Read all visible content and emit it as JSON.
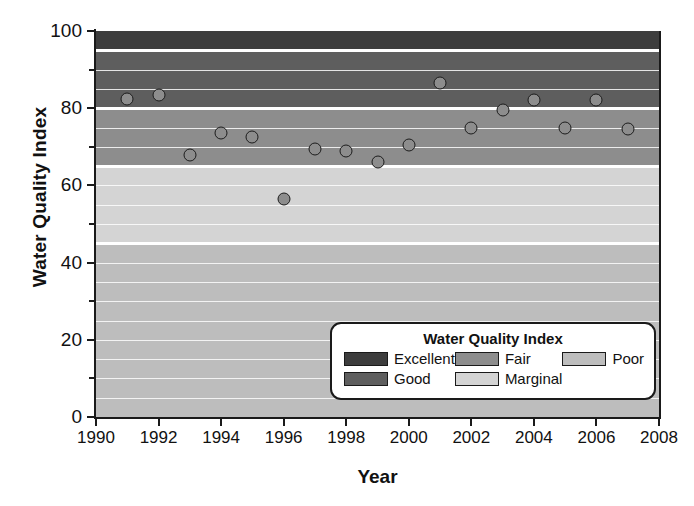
{
  "chart_data": {
    "type": "scatter",
    "title": "",
    "xlabel": "Year",
    "ylabel": "Water Quality Index",
    "xlim": [
      1990,
      2008
    ],
    "ylim": [
      0,
      100
    ],
    "grid": true,
    "xticks": [
      1990,
      1992,
      1994,
      1996,
      1998,
      2000,
      2002,
      2004,
      2006,
      2008
    ],
    "xtick_labels": [
      "1990",
      "1992",
      "1994",
      "1996",
      "1998",
      "2000",
      "2002",
      "2004",
      "2006",
      "2008"
    ],
    "yticks": [
      0,
      20,
      40,
      60,
      80,
      100
    ],
    "ytick_labels": [
      "0",
      "20",
      "40",
      "60",
      "80",
      "100"
    ],
    "yticks_minor": [
      10,
      30,
      50,
      70,
      90
    ],
    "series": [
      {
        "name": "Water Quality Index",
        "marker": "circle",
        "marker_face": "#8d8d8d",
        "marker_edge": "#1c1c1c",
        "x": [
          1991,
          1992,
          1993,
          1994,
          1995,
          1996,
          1997,
          1998,
          1999,
          2000,
          2001,
          2002,
          2003,
          2004,
          2005,
          2006,
          2007
        ],
        "y": [
          82.5,
          83.5,
          68.0,
          73.5,
          72.5,
          56.5,
          69.5,
          69.0,
          66.0,
          70.5,
          86.5,
          75.0,
          79.5,
          82.0,
          75.0,
          82.0,
          74.5
        ]
      }
    ],
    "bands": [
      {
        "label": "Excellent",
        "from": 95,
        "to": 100,
        "color": "#3d3d3d"
      },
      {
        "label": "Good",
        "from": 80,
        "to": 95,
        "color": "#5e5e5e"
      },
      {
        "label": "Fair",
        "from": 65,
        "to": 80,
        "color": "#8d8d8d"
      },
      {
        "label": "Marginal",
        "from": 45,
        "to": 65,
        "color": "#d4d4d4"
      },
      {
        "label": "Poor",
        "from": 0,
        "to": 45,
        "color": "#bdbdbd"
      }
    ]
  },
  "legend": {
    "title": "Water Quality Index",
    "columns": [
      [
        {
          "label": "Excellent",
          "color": "#3d3d3d"
        },
        {
          "label": "Good",
          "color": "#5e5e5e"
        }
      ],
      [
        {
          "label": "Fair",
          "color": "#8d8d8d"
        },
        {
          "label": "Marginal",
          "color": "#d4d4d4"
        }
      ],
      [
        {
          "label": "Poor",
          "color": "#bdbdbd"
        }
      ]
    ]
  }
}
